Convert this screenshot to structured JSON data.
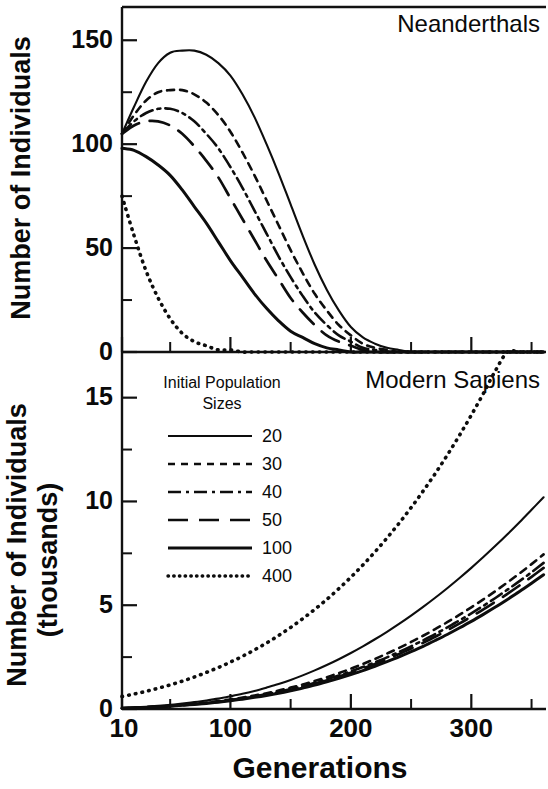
{
  "figure": {
    "shared_x_axis_title": "Generations",
    "panels": [
      {
        "id": "neanderthals",
        "title": "Neanderthals",
        "y_axis_title": "Number of Individuals",
        "y_ticks": [
          "150",
          "100",
          "50",
          "0"
        ]
      },
      {
        "id": "modern-sapiens",
        "title": "Modern Sapiens",
        "y_axis_title_line1": "Number of Individuals",
        "y_axis_title_line2": "(thousands)",
        "y_ticks": [
          "15",
          "10",
          "5",
          "0"
        ]
      }
    ],
    "x_ticks": [
      "10",
      "100",
      "200",
      "300"
    ]
  },
  "legend": {
    "title_line1": "Initial Population",
    "title_line2": "Sizes",
    "entries": [
      {
        "label": "20",
        "style": "solid-thin"
      },
      {
        "label": "30",
        "style": "dashed"
      },
      {
        "label": "40",
        "style": "dashdot"
      },
      {
        "label": "50",
        "style": "longdash"
      },
      {
        "label": "100",
        "style": "solid-thick"
      },
      {
        "label": "400",
        "style": "dotted"
      }
    ]
  },
  "chart_data": {
    "type": "line",
    "panel_count": 2,
    "grid": false,
    "legend_position": "inside-upper-left-of-lower-panel",
    "xlabel": "Generations",
    "x": [
      10,
      20,
      30,
      40,
      50,
      60,
      70,
      80,
      90,
      100,
      110,
      120,
      130,
      140,
      150,
      160,
      170,
      180,
      190,
      200,
      210,
      220,
      230,
      240,
      250,
      260,
      270,
      280,
      290,
      300,
      310,
      320,
      330,
      340,
      350,
      360
    ],
    "xlim": [
      10,
      362
    ],
    "x_major_ticks": [
      10,
      100,
      200,
      300
    ],
    "x_minor_ticks": [
      50,
      150,
      250,
      350
    ],
    "panels": [
      {
        "name": "Neanderthals",
        "ylabel": "Number of Individuals",
        "ylim": [
          0,
          166
        ],
        "y_major_ticks": [
          0,
          50,
          100,
          150
        ],
        "y_minor_ticks": [
          25,
          75,
          125
        ],
        "units": "individuals",
        "series": [
          {
            "name": "20",
            "style": "solid-thin",
            "values": [
              105,
              118,
              130,
              139,
              144,
              145,
              145,
              143,
              139,
              133,
              124,
              113,
              100,
              86,
              71,
              56,
              42,
              30,
              20,
              12,
              7,
              4,
              2,
              1,
              0,
              0,
              0,
              0,
              0,
              0,
              0,
              0,
              0,
              0,
              0,
              0
            ]
          },
          {
            "name": "30",
            "style": "dashed",
            "values": [
              105,
              114,
              121,
              125,
              126,
              126,
              124,
              120,
              114,
              106,
              96,
              85,
              73,
              61,
              49,
              38,
              28,
              20,
              13,
              8,
              4,
              2,
              1,
              0,
              0,
              0,
              0,
              0,
              0,
              0,
              0,
              0,
              0,
              0,
              0,
              0
            ]
          },
          {
            "name": "40",
            "style": "dashdot",
            "values": [
              105,
              111,
              115,
              117,
              117,
              115,
              111,
              105,
              98,
              89,
              79,
              68,
              57,
              46,
              36,
              27,
              19,
              13,
              8,
              5,
              2,
              1,
              0,
              0,
              0,
              0,
              0,
              0,
              0,
              0,
              0,
              0,
              0,
              0,
              0,
              0
            ]
          },
          {
            "name": "50",
            "style": "longdash",
            "values": [
              105,
              109,
              111,
              111,
              109,
              105,
              99,
              92,
              84,
              74,
              64,
              54,
              44,
              35,
              26,
              19,
              13,
              8,
              5,
              3,
              1,
              0,
              0,
              0,
              0,
              0,
              0,
              0,
              0,
              0,
              0,
              0,
              0,
              0,
              0,
              0
            ]
          },
          {
            "name": "100",
            "style": "solid-thick",
            "values": [
              98,
              97,
              94,
              90,
              85,
              78,
              70,
              62,
              53,
              44,
              36,
              28,
              21,
              15,
              10,
              7,
              4,
              2,
              1,
              0,
              0,
              0,
              0,
              0,
              0,
              0,
              0,
              0,
              0,
              0,
              0,
              0,
              0,
              0,
              0,
              0
            ]
          },
          {
            "name": "400",
            "style": "dotted",
            "values": [
              75,
              56,
              39,
              26,
              16,
              9,
              5,
              3,
              1,
              1,
              0,
              0,
              0,
              0,
              0,
              0,
              0,
              0,
              0,
              0,
              0,
              0,
              0,
              0,
              0,
              0,
              0,
              0,
              0,
              0,
              0,
              0,
              0,
              0,
              0,
              0
            ]
          }
        ]
      },
      {
        "name": "Modern Sapiens",
        "ylabel": "Number of Individuals (thousands)",
        "ylim": [
          0,
          17.2
        ],
        "y_major_ticks": [
          0,
          5,
          10,
          15
        ],
        "y_minor_ticks": [
          2.5,
          7.5,
          12.5
        ],
        "units": "thousands of individuals",
        "series": [
          {
            "name": "20",
            "style": "solid-thin",
            "values": [
              0.05,
              0.08,
              0.11,
              0.15,
              0.2,
              0.26,
              0.33,
              0.41,
              0.5,
              0.61,
              0.73,
              0.87,
              1.03,
              1.2,
              1.4,
              1.62,
              1.86,
              2.12,
              2.4,
              2.7,
              3.02,
              3.36,
              3.72,
              4.1,
              4.5,
              4.92,
              5.36,
              5.82,
              6.3,
              6.8,
              7.32,
              7.86,
              8.42,
              9.0,
              9.6,
              10.2
            ]
          },
          {
            "name": "30",
            "style": "dashed",
            "values": [
              0.04,
              0.06,
              0.09,
              0.12,
              0.16,
              0.2,
              0.25,
              0.31,
              0.38,
              0.46,
              0.55,
              0.65,
              0.76,
              0.89,
              1.03,
              1.18,
              1.35,
              1.53,
              1.73,
              1.94,
              2.17,
              2.41,
              2.67,
              2.94,
              3.23,
              3.53,
              3.85,
              4.18,
              4.53,
              4.9,
              5.28,
              5.68,
              6.1,
              6.53,
              6.98,
              7.45
            ]
          },
          {
            "name": "40",
            "style": "dashdot",
            "values": [
              0.04,
              0.06,
              0.085,
              0.115,
              0.15,
              0.19,
              0.235,
              0.29,
              0.355,
              0.43,
              0.515,
              0.61,
              0.715,
              0.83,
              0.96,
              1.1,
              1.26,
              1.43,
              1.61,
              1.81,
              2.02,
              2.25,
              2.49,
              2.75,
              3.02,
              3.31,
              3.61,
              3.93,
              4.26,
              4.61,
              4.97,
              5.35,
              5.75,
              6.16,
              6.59,
              7.04
            ]
          },
          {
            "name": "50",
            "style": "longdash",
            "values": [
              0.035,
              0.055,
              0.08,
              0.11,
              0.145,
              0.185,
              0.23,
              0.285,
              0.35,
              0.42,
              0.5,
              0.59,
              0.69,
              0.8,
              0.93,
              1.07,
              1.22,
              1.38,
              1.56,
              1.75,
              1.95,
              2.17,
              2.4,
              2.65,
              2.91,
              3.19,
              3.48,
              3.79,
              4.11,
              4.45,
              4.8,
              5.17,
              5.55,
              5.95,
              6.37,
              6.8
            ]
          },
          {
            "name": "100",
            "style": "solid-thick",
            "values": [
              0.03,
              0.05,
              0.075,
              0.1,
              0.135,
              0.175,
              0.22,
              0.27,
              0.33,
              0.4,
              0.475,
              0.56,
              0.655,
              0.76,
              0.88,
              1.01,
              1.15,
              1.31,
              1.48,
              1.66,
              1.85,
              2.06,
              2.28,
              2.51,
              2.76,
              3.02,
              3.3,
              3.59,
              3.9,
              4.22,
              4.56,
              4.91,
              5.28,
              5.66,
              6.06,
              6.47
            ]
          },
          {
            "name": "400",
            "style": "dotted",
            "values": [
              0.6,
              0.72,
              0.85,
              1.0,
              1.16,
              1.34,
              1.54,
              1.76,
              2.0,
              2.26,
              2.54,
              2.85,
              3.18,
              3.54,
              3.93,
              4.35,
              4.8,
              5.28,
              5.8,
              6.35,
              6.94,
              7.57,
              8.24,
              8.95,
              9.7,
              10.5,
              11.34,
              12.23,
              13.17,
              14.16,
              15.2,
              16.3,
              17.45,
              18.65,
              19.9,
              21.2
            ]
          }
        ]
      }
    ]
  }
}
